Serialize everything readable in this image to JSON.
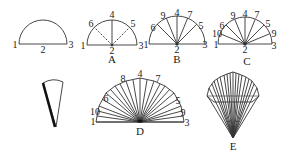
{
  "diagram": {
    "colors": {
      "stroke": "#333333",
      "background": "#ffffff"
    },
    "figures": [
      {
        "id": "start",
        "caption": "",
        "labels": {
          "p1": "1",
          "p2": "2",
          "p3": "3"
        }
      },
      {
        "id": "A",
        "caption": "A",
        "labels": {
          "p1": "1",
          "p2": "2",
          "p3": "3",
          "p4": "4",
          "p5": "5",
          "p6": "6"
        }
      },
      {
        "id": "B",
        "caption": "B",
        "labels": {
          "p1": "1",
          "p2": "2",
          "p3": "3",
          "p4": "4",
          "p5": "5",
          "p6": "6",
          "p7": "7",
          "p9": "9"
        }
      },
      {
        "id": "C",
        "caption": "C",
        "labels": {
          "p1": "1",
          "p2": "2",
          "p3": "3",
          "p4": "4",
          "p5": "5",
          "p6": "6",
          "p7": "7",
          "p9a": "9",
          "p9b": "9",
          "p10": "10"
        }
      },
      {
        "id": "cone",
        "caption": ""
      },
      {
        "id": "D",
        "caption": "D",
        "labels": {
          "p1": "1",
          "p3": "3",
          "p4": "4",
          "p5": "5",
          "p6": "6",
          "p7": "7",
          "p8": "8",
          "p9": "9",
          "p10": "10"
        }
      },
      {
        "id": "E",
        "caption": "E"
      }
    ]
  }
}
